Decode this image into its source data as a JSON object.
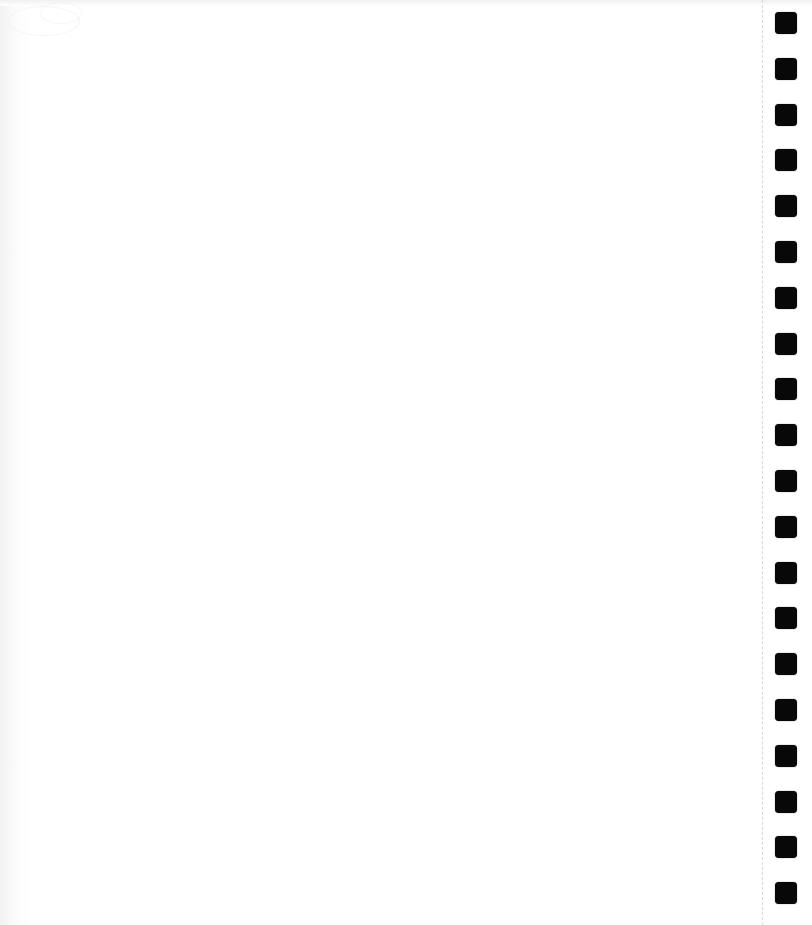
{
  "page": {
    "type": "scanned blank sheet",
    "content_text": "",
    "background_color": "#ffffff"
  },
  "binding": {
    "side": "right",
    "hole_count": 20,
    "hole_color": "#080808",
    "hole_shape": "rounded-square",
    "perforation_line": "dashed"
  }
}
